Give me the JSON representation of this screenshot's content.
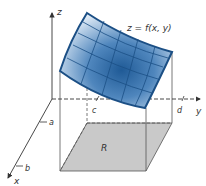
{
  "figure": {
    "surface_label": "z = f(x, y)",
    "region_label": "R",
    "axes": {
      "x": "x",
      "y": "y",
      "z": "z"
    },
    "ticks": {
      "a": "a",
      "b": "b",
      "c": "c",
      "d": "d"
    },
    "colors": {
      "surface_dark": "#1f5a96",
      "surface_light": "#dce8f4",
      "surface_edge": "#1b4f85",
      "region_fill": "#c8c8c8",
      "axis": "#333333"
    }
  }
}
